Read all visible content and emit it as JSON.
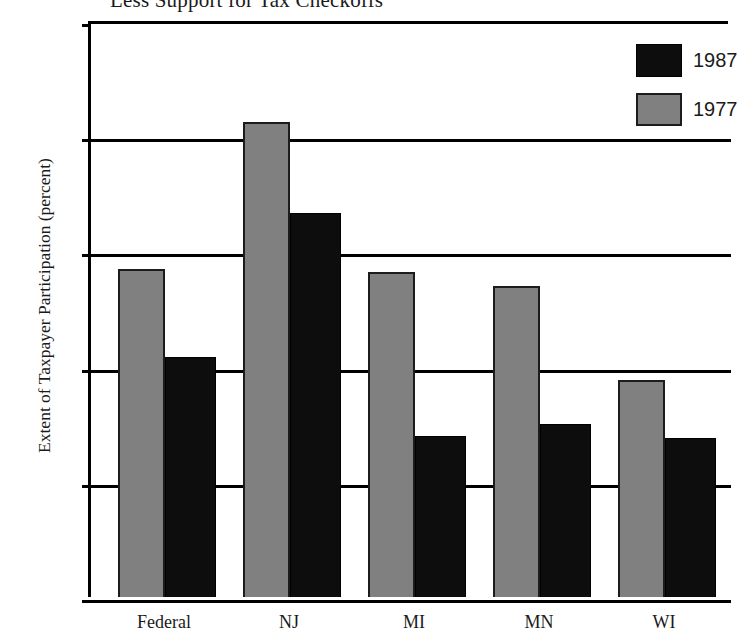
{
  "chart_data": {
    "type": "bar",
    "title": "Less Support for Tax Checkoffs",
    "xlabel": "",
    "ylabel": "Extent of Taxpayer Participation (percent)",
    "ylim": [
      0,
      50
    ],
    "yticks": [
      0,
      10,
      20,
      30,
      40,
      50
    ],
    "ytick_labels": [
      "0",
      "10",
      "20",
      "30",
      "40",
      "50"
    ],
    "grid": true,
    "grid_axis": "y",
    "legend_position": "top-right",
    "categories": [
      "Federal",
      "NJ",
      "MI",
      "MN",
      "WI"
    ],
    "series": [
      {
        "name": "1977",
        "color": "#808080",
        "values": [
          28.5,
          41.2,
          28.2,
          27.0,
          18.8
        ]
      },
      {
        "name": "1987",
        "color": "#0d0d0d",
        "values": [
          20.8,
          33.3,
          14.0,
          15.0,
          13.8
        ]
      }
    ],
    "legend_order": [
      "1987",
      "1977"
    ]
  },
  "legend": {
    "entries": [
      {
        "label": "1987",
        "swatch": "black"
      },
      {
        "label": "1977",
        "swatch": "gray"
      }
    ]
  }
}
